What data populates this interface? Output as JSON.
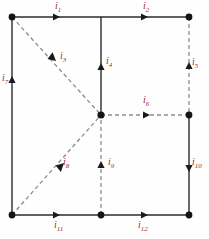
{
  "diagram": {
    "type": "circuit-graph",
    "background_color": "#fefefe",
    "node_color": "#151515",
    "solid_edge_color": "#2b2b2b",
    "dashed_edge_color": "#8c8c8c",
    "label_color": "#9e2b34",
    "nodes": [
      {
        "name": "node-top-left",
        "x": 12,
        "y": 17,
        "marker": true
      },
      {
        "name": "node-top-middle",
        "x": 101,
        "y": 17,
        "marker": false
      },
      {
        "name": "node-top-right",
        "x": 189,
        "y": 17,
        "marker": true
      },
      {
        "name": "node-center",
        "x": 101,
        "y": 115,
        "marker": true
      },
      {
        "name": "node-right-middle",
        "x": 189,
        "y": 115,
        "marker": true
      },
      {
        "name": "node-bottom-left",
        "x": 12,
        "y": 215,
        "marker": true
      },
      {
        "name": "node-bottom-middle",
        "x": 101,
        "y": 215,
        "marker": true
      },
      {
        "name": "node-bottom-right",
        "x": 189,
        "y": 215,
        "marker": true
      }
    ],
    "edges": [
      {
        "id": "i1",
        "label": "i",
        "subscript": "1",
        "style": "solid",
        "from": "node-top-left",
        "to": "node-top-middle",
        "arrow_dir": "right",
        "arrow_at": [
          60,
          17
        ],
        "label_pos": [
          55,
          1
        ]
      },
      {
        "id": "i2",
        "label": "i",
        "subscript": "2",
        "style": "solid",
        "from": "node-top-middle",
        "to": "node-top-right",
        "arrow_dir": "right",
        "arrow_at": [
          146,
          17
        ],
        "label_pos": [
          143,
          1
        ]
      },
      {
        "id": "i3",
        "label": "i",
        "subscript": "3",
        "style": "dashed",
        "from": "node-top-left",
        "to": "node-center",
        "arrow_dir": "down-right",
        "arrow_at": [
          54,
          59
        ],
        "label_pos": [
          60,
          51
        ]
      },
      {
        "id": "i4",
        "label": "i",
        "subscript": "4",
        "style": "solid",
        "from": "node-center",
        "to": "node-top-middle",
        "arrow_dir": "up",
        "arrow_at": [
          101,
          66
        ],
        "label_pos": [
          106,
          56
        ]
      },
      {
        "id": "i5",
        "label": "i",
        "subscript": "5",
        "style": "dashed",
        "from": "node-right-middle",
        "to": "node-top-right",
        "arrow_dir": "up",
        "arrow_at": [
          189,
          66
        ],
        "label_pos": [
          192,
          57
        ]
      },
      {
        "id": "i6",
        "label": "i",
        "subscript": "6",
        "style": "dashed",
        "from": "node-center",
        "to": "node-right-middle",
        "arrow_dir": "right",
        "arrow_at": [
          147,
          115
        ],
        "label_pos": [
          143,
          95
        ]
      },
      {
        "id": "i7",
        "label": "i",
        "subscript": "7",
        "style": "solid",
        "from": "node-bottom-left",
        "to": "node-top-left",
        "arrow_dir": "up",
        "arrow_at": [
          12,
          80
        ],
        "label_pos": [
          2,
          73
        ]
      },
      {
        "id": "i8",
        "label": "i",
        "subscript": "8",
        "style": "dashed",
        "from": "node-bottom-left",
        "to": "node-center",
        "arrow_dir": "up-right",
        "arrow_at": [
          60,
          167
        ],
        "label_pos": [
          63,
          157
        ]
      },
      {
        "id": "i9",
        "label": "i",
        "subscript": "9",
        "style": "dashed",
        "from": "node-bottom-middle",
        "to": "node-center",
        "arrow_dir": "up",
        "arrow_at": [
          101,
          165
        ],
        "label_pos": [
          108,
          157
        ]
      },
      {
        "id": "i10",
        "label": "i",
        "subscript": "10",
        "style": "solid",
        "from": "node-right-middle",
        "to": "node-bottom-right",
        "arrow_dir": "down",
        "arrow_at": [
          189,
          168
        ],
        "label_pos": [
          192,
          157
        ]
      },
      {
        "id": "i11",
        "label": "i",
        "subscript": "11",
        "style": "solid",
        "from": "node-bottom-left",
        "to": "node-bottom-middle",
        "arrow_dir": "right",
        "arrow_at": [
          60,
          215
        ],
        "label_pos": [
          54,
          220
        ]
      },
      {
        "id": "i12",
        "label": "i",
        "subscript": "12",
        "style": "solid",
        "from": "node-bottom-middle",
        "to": "node-bottom-right",
        "arrow_dir": "right",
        "arrow_at": [
          146,
          215
        ],
        "label_pos": [
          138,
          220
        ]
      }
    ]
  }
}
